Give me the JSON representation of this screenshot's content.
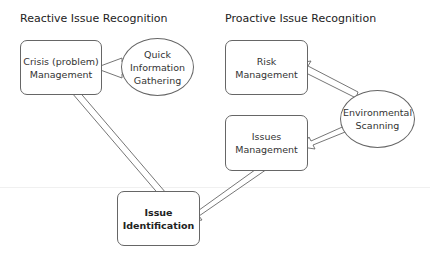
{
  "headers": {
    "reactive": "Reactive Issue Recognition",
    "proactive": "Proactive Issue Recognition"
  },
  "nodes": {
    "crisis": {
      "line1": "Crisis (problem)",
      "line2": "Management"
    },
    "quick_info": {
      "line1": "Quick",
      "line2": "Information",
      "line3": "Gathering"
    },
    "risk": {
      "line1": "Risk",
      "line2": "Management"
    },
    "environmental": {
      "line1": "Environmental",
      "line2": "Scanning"
    },
    "issues_mgmt": {
      "line1": "Issues",
      "line2": "Management"
    },
    "issue_id": {
      "line1": "Issue",
      "line2": "Identification"
    }
  },
  "edges": [
    {
      "from": "quick_info",
      "to": "crisis"
    },
    {
      "from": "crisis",
      "to": "issue_id"
    },
    {
      "from": "environmental",
      "to": "risk"
    },
    {
      "from": "environmental",
      "to": "issues_mgmt"
    },
    {
      "from": "issues_mgmt",
      "to": "issue_id"
    }
  ]
}
